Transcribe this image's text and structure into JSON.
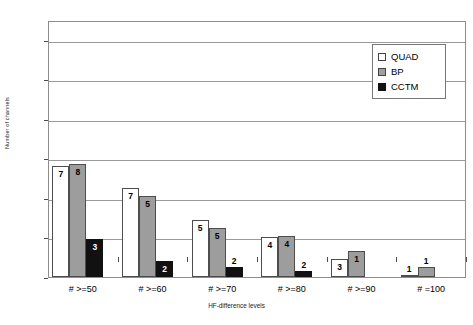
{
  "chart_data": {
    "type": "bar",
    "title": "",
    "xlabel": "HF-difference levels",
    "ylabel": "Number of channels",
    "categories": [
      "# >=50",
      "# >=60",
      "# >=70",
      "# >=80",
      "# >=90",
      "# =100"
    ],
    "ylim": [
      0,
      130
    ],
    "yticks": [
      0,
      20,
      40,
      60,
      80,
      100,
      120
    ],
    "ytick_labels": [
      "0",
      "20",
      "40",
      "60",
      "80",
      "100",
      "120"
    ],
    "grid": true,
    "legend_position": "upper right",
    "series": [
      {
        "name": "QUAD",
        "color": "#ffffff",
        "values": [
          56,
          45,
          29,
          20,
          9,
          1
        ],
        "data_labels": [
          "7",
          "7",
          "5",
          "4",
          "3",
          "1"
        ]
      },
      {
        "name": "BP",
        "color": "#9d9d9d",
        "values": [
          57,
          41,
          25,
          21,
          13,
          5
        ],
        "data_labels": [
          "8",
          "5",
          "5",
          "4",
          "1",
          "1"
        ]
      },
      {
        "name": "CCTM",
        "color": "#111111",
        "values": [
          19,
          8,
          5,
          3,
          0,
          0
        ],
        "data_labels": [
          "3",
          "2",
          "2",
          "2",
          "",
          ""
        ]
      }
    ]
  },
  "legend": {
    "items": [
      {
        "label": "QUAD",
        "swatch": "quad"
      },
      {
        "label": "BP",
        "swatch": "bp"
      },
      {
        "label": "CCTM",
        "swatch": "cctm"
      }
    ]
  }
}
